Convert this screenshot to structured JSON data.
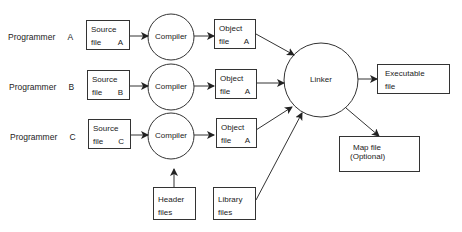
{
  "programmers": [
    {
      "label": "Programmer",
      "id": "A",
      "source": {
        "line1": "Source",
        "line2": "file",
        "id": "A"
      },
      "object": {
        "line1": "Object",
        "line2": "file",
        "id": "A"
      }
    },
    {
      "label": "Programmer",
      "id": "B",
      "source": {
        "line1": "Source",
        "line2": "file",
        "id": "B"
      },
      "object": {
        "line1": "Object",
        "line2": "file",
        "id": "A"
      }
    },
    {
      "label": "Programmer",
      "id": "C",
      "source": {
        "line1": "Source",
        "line2": "file",
        "id": "C"
      },
      "object": {
        "line1": "Object",
        "line2": "file",
        "id": "A"
      }
    }
  ],
  "compiler_label": "Compiler",
  "linker_label": "Linker",
  "header": {
    "line1": "Header",
    "line2": "files"
  },
  "library": {
    "line1": "Library",
    "line2": "files"
  },
  "executable": {
    "line1": "Executable",
    "line2": "file"
  },
  "map": {
    "line1": "Map file",
    "line2": "(Optional)"
  }
}
